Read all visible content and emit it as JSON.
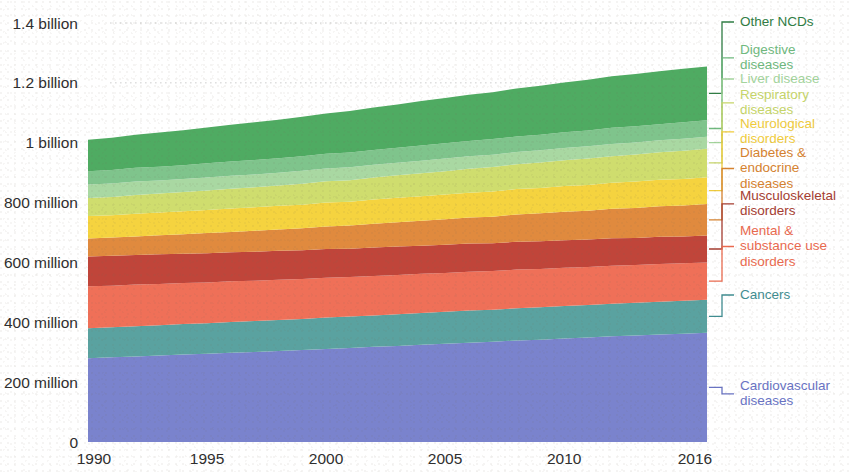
{
  "chart_data": {
    "type": "area",
    "title": "",
    "subtitle": "",
    "xlabel": "",
    "ylabel": "",
    "stacked": true,
    "grid": "horizontal-dotted",
    "legend_position": "right",
    "xlim": [
      1990,
      2016
    ],
    "ylim": [
      0,
      1400
    ],
    "y_unit": "millions of people",
    "x": [
      1990,
      1991,
      1992,
      1993,
      1994,
      1995,
      1996,
      1997,
      1998,
      1999,
      2000,
      2001,
      2002,
      2003,
      2004,
      2005,
      2006,
      2007,
      2008,
      2009,
      2010,
      2011,
      2012,
      2013,
      2014,
      2015,
      2016
    ],
    "xticks": [
      1990,
      1995,
      2000,
      2005,
      2010,
      2016
    ],
    "xtick_labels": [
      "1990",
      "1995",
      "2000",
      "2005",
      "2010",
      "2016"
    ],
    "yticks": [
      0,
      200,
      400,
      600,
      800,
      1000,
      1200,
      1400
    ],
    "ytick_labels": [
      "0",
      "200 million",
      "400 million",
      "600 million",
      "800 million",
      "1 billion",
      "1.2 billion",
      "1.4 billion"
    ],
    "series": [
      {
        "name": "Cardiovascular diseases",
        "color": "#7a83cd",
        "legend_label_line1": "Cardiovascular",
        "legend_label_line2": "diseases",
        "values": [
          280,
          283,
          286,
          289,
          292,
          295,
          298,
          301,
          304,
          307,
          311,
          314,
          318,
          321,
          325,
          328,
          332,
          335,
          339,
          342,
          346,
          349,
          353,
          356,
          359,
          362,
          365
        ]
      },
      {
        "name": "Cancers",
        "color": "#5aa2a0",
        "legend_label_line1": "Cancers",
        "legend_label_line2": "",
        "values": [
          100,
          100,
          101,
          101,
          102,
          102,
          103,
          103,
          104,
          104,
          105,
          105,
          105,
          106,
          106,
          107,
          107,
          107,
          108,
          108,
          108,
          109,
          109,
          109,
          110,
          110,
          110
        ]
      },
      {
        "name": "Mental & substance use disorders",
        "color": "#ef7058",
        "legend_label_line1": "Mental &",
        "legend_label_line2": "substance use",
        "legend_label_line3": "disorders",
        "values": [
          140,
          139,
          139,
          138,
          137,
          136,
          136,
          135,
          134,
          134,
          133,
          132,
          132,
          131,
          131,
          130,
          130,
          129,
          129,
          128,
          128,
          127,
          127,
          126,
          126,
          125,
          125
        ]
      },
      {
        "name": "Musculoskeletal disorders",
        "color": "#c0453a",
        "legend_label_line1": "Musculoskeletal",
        "legend_label_line2": "disorders",
        "values": [
          100,
          100,
          99,
          99,
          98,
          98,
          97,
          97,
          97,
          96,
          96,
          95,
          95,
          95,
          94,
          94,
          94,
          93,
          93,
          93,
          92,
          92,
          92,
          91,
          91,
          90,
          90
        ]
      },
      {
        "name": "Diabetes & endocrine diseases",
        "color": "#e08a3e",
        "legend_label_line1": "Diabetes &",
        "legend_label_line2": "endocrine",
        "legend_label_line3": "diseases",
        "values": [
          60,
          61,
          62,
          64,
          65,
          67,
          68,
          70,
          71,
          73,
          75,
          77,
          79,
          81,
          83,
          85,
          87,
          89,
          91,
          93,
          95,
          96,
          98,
          100,
          102,
          103,
          105
        ]
      },
      {
        "name": "Neurological disorders",
        "color": "#f5d33f",
        "legend_label_line1": "Neurological",
        "legend_label_line2": "disorders",
        "values": [
          75,
          75,
          76,
          76,
          77,
          77,
          78,
          78,
          79,
          79,
          80,
          80,
          81,
          82,
          82,
          83,
          83,
          84,
          85,
          85,
          86,
          86,
          87,
          88,
          88,
          89,
          90
        ]
      },
      {
        "name": "Respiratory diseases",
        "color": "#cfdd6e",
        "legend_label_line1": "Respiratory",
        "legend_label_line2": "diseases",
        "values": [
          60,
          61,
          62,
          63,
          64,
          65,
          66,
          67,
          68,
          70,
          71,
          72,
          74,
          75,
          77,
          78,
          80,
          82,
          83,
          85,
          86,
          88,
          89,
          91,
          92,
          94,
          95
        ]
      },
      {
        "name": "Liver disease",
        "color": "#a9d8a2",
        "legend_label_line1": "Liver disease",
        "legend_label_line2": "",
        "values": [
          45,
          45,
          45,
          44,
          44,
          44,
          44,
          43,
          43,
          43,
          43,
          43,
          42,
          42,
          42,
          42,
          42,
          41,
          41,
          41,
          41,
          41,
          41,
          40,
          40,
          40,
          40
        ]
      },
      {
        "name": "Digestive diseases",
        "color": "#7fc48c",
        "legend_label_line1": "Digestive",
        "legend_label_line2": "diseases",
        "values": [
          45,
          45,
          46,
          46,
          46,
          47,
          47,
          48,
          48,
          49,
          49,
          49,
          50,
          50,
          51,
          51,
          51,
          52,
          52,
          52,
          53,
          53,
          54,
          54,
          54,
          55,
          55
        ]
      },
      {
        "name": "Other NCDs",
        "color": "#4fab62",
        "legend_label_line1": "Other NCDs",
        "legend_label_line2": "",
        "values": [
          105,
          108,
          111,
          114,
          117,
          120,
          123,
          126,
          129,
          132,
          135,
          139,
          142,
          145,
          148,
          151,
          154,
          157,
          160,
          163,
          166,
          169,
          172,
          175,
          177,
          179,
          180
        ]
      }
    ],
    "legend_entries": [
      {
        "name": "Other NCDs",
        "color": "#2f7d44",
        "lines": [
          "Other NCDs"
        ]
      },
      {
        "name": "Digestive diseases",
        "color": "#6fb97e",
        "lines": [
          "Digestive",
          "diseases"
        ]
      },
      {
        "name": "Liver disease",
        "color": "#a3d49c",
        "lines": [
          "Liver disease"
        ]
      },
      {
        "name": "Respiratory diseases",
        "color": "#c6d56a",
        "lines": [
          "Respiratory",
          "diseases"
        ]
      },
      {
        "name": "Neurological disorders",
        "color": "#efcb3c",
        "lines": [
          "Neurological",
          "disorders"
        ]
      },
      {
        "name": "Diabetes & endocrine diseases",
        "color": "#d6822f",
        "lines": [
          "Diabetes &",
          "endocrine",
          "diseases"
        ]
      },
      {
        "name": "Musculoskeletal disorders",
        "color": "#a63c31",
        "lines": [
          "Musculoskeletal",
          "disorders"
        ]
      },
      {
        "name": "Mental & substance use disorders",
        "color": "#ea6a4f",
        "lines": [
          "Mental &",
          "substance use",
          "disorders"
        ]
      },
      {
        "name": "Cancers",
        "color": "#3f8d91",
        "lines": [
          "Cancers"
        ]
      },
      {
        "name": "Cardiovascular diseases",
        "color": "#6973c4",
        "lines": [
          "Cardiovascular",
          "diseases"
        ]
      }
    ]
  }
}
